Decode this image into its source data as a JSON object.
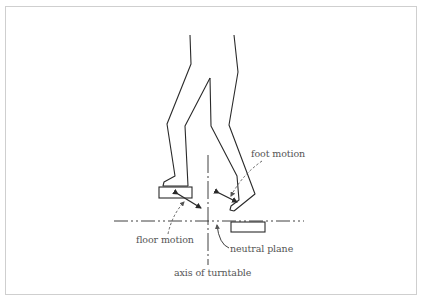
{
  "figure": {
    "type": "line-drawing",
    "labels": {
      "foot_motion": "foot motion",
      "floor_motion": "floor motion",
      "neutral_plane": "neutral plane",
      "axis_of_turntable": "axis of turntable"
    },
    "colors": {
      "line": "#2a2a2a",
      "leader": "#555555",
      "frame": "#cfcfcf",
      "text": "#555555"
    }
  }
}
